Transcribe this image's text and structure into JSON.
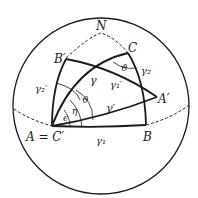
{
  "diagram": {
    "type": "spherical-geometry",
    "stroke_color": "#1a1a1a",
    "background": "#ffffff",
    "labels": {
      "north": "N",
      "b_prime": "B′",
      "c": "C",
      "a_prime": "A′",
      "a_eq_c_prime": "A = C′",
      "b": "B",
      "gamma": "γ",
      "gamma_prime": "γ′",
      "gamma1": "γ₁",
      "gamma1_prime": "γ₁′",
      "gamma2": "γ₂",
      "gamma2_prime": "γ₂′",
      "theta_top": "ϑ",
      "theta_mid": "ϑ",
      "eta": "η",
      "epsilon": "ϵ"
    }
  }
}
